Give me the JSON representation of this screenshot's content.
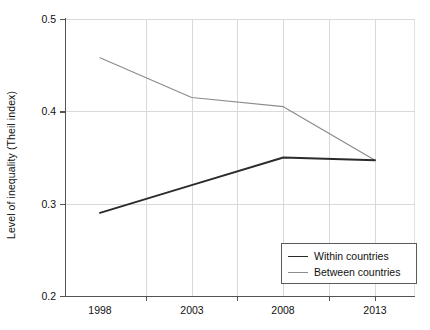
{
  "chart_data": {
    "type": "line",
    "title": "",
    "xlabel": "",
    "ylabel": "Level of inequality (Theil index)",
    "x": [
      1998,
      2003,
      2008,
      2013
    ],
    "xtick_labels": [
      "1998",
      "2003",
      "2008",
      "2013"
    ],
    "ytick_labels": [
      "0.2",
      "0.3",
      "0.4",
      "0.5"
    ],
    "ytick_values": [
      0.2,
      0.3,
      0.4,
      0.5
    ],
    "xlim": [
      1998,
      2013
    ],
    "ylim": [
      0.2,
      0.5
    ],
    "grid": true,
    "legend_position": "bottom-right",
    "series": [
      {
        "name": "Within countries",
        "color": "#2b2b2b",
        "values": [
          0.29,
          0.32,
          0.35,
          0.347
        ]
      },
      {
        "name": "Between countries",
        "color": "#8c8c8c",
        "values": [
          0.458,
          0.415,
          0.405,
          0.347
        ]
      }
    ]
  },
  "axes": {
    "y_title": "Level of inequality (Theil index)",
    "y_ticks": [
      {
        "label": "0.5",
        "y": 19
      },
      {
        "label": "0.4",
        "y": 111.3
      },
      {
        "label": "0.3",
        "y": 203.7
      },
      {
        "label": "0.2",
        "y": 296
      }
    ],
    "x_ticks": [
      {
        "label": "1998",
        "x": 100
      },
      {
        "label": "2003",
        "x": 192
      },
      {
        "label": "2008",
        "x": 283
      },
      {
        "label": "2013",
        "x": 375
      }
    ],
    "x_gridlines": [
      146,
      192,
      237,
      283,
      329,
      375
    ],
    "x_tickmarks": [
      146,
      237,
      329,
      375
    ]
  },
  "legend": {
    "items": [
      {
        "label": "Within countries",
        "color": "#2b2b2b",
        "width": "1.9px"
      },
      {
        "label": "Between countries",
        "color": "#8c8c8c",
        "width": "1.2px"
      }
    ]
  }
}
